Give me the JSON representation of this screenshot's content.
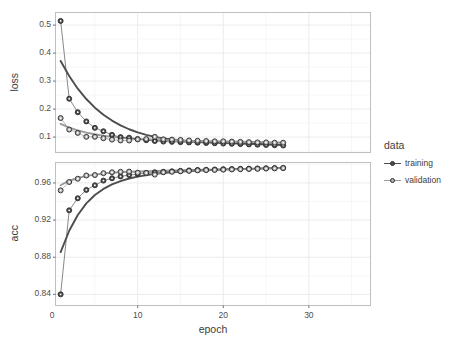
{
  "chart_data": {
    "type": "scatter",
    "title": "",
    "xlabel": "epoch",
    "legend_title": "data",
    "legend_position": "right",
    "grid": true,
    "xlim": [
      0.4,
      37.2
    ],
    "xticks": [
      0,
      10,
      20,
      30
    ],
    "xtick_labels": [
      "0",
      "10",
      "20",
      "30"
    ],
    "panels": [
      {
        "name": "loss",
        "ylabel": "loss",
        "ylim": [
          0.045,
          0.545
        ],
        "yticks": [
          0.1,
          0.2,
          0.3,
          0.4,
          0.5
        ],
        "ytick_labels": [
          "0.1",
          "0.2",
          "0.3",
          "0.4",
          "0.5"
        ],
        "series": [
          {
            "name": "training",
            "color": "#4d4d4d",
            "fill": "#4d4d4d",
            "x": [
              1,
              2,
              3,
              4,
              5,
              6,
              7,
              8,
              9,
              10,
              11,
              12,
              13,
              14,
              15,
              16,
              17,
              18,
              19,
              20,
              21,
              22,
              23,
              24,
              25,
              26,
              27
            ],
            "values": [
              0.515,
              0.237,
              0.189,
              0.156,
              0.133,
              0.121,
              0.108,
              0.1,
              0.098,
              0.093,
              0.089,
              0.086,
              0.084,
              0.083,
              0.082,
              0.081,
              0.08,
              0.079,
              0.078,
              0.077,
              0.076,
              0.075,
              0.074,
              0.073,
              0.072,
              0.071,
              0.07
            ],
            "smooth_x": [
              1.0,
              2.0,
              3.0,
              4.0,
              5.0,
              6.0,
              7.0,
              8.0,
              9.0,
              10.0,
              11.0,
              12.0,
              13.0,
              14.0,
              16.0,
              18.0,
              20.0,
              22.0,
              24.0,
              26.0,
              27.0
            ],
            "smooth_y": [
              0.372,
              0.318,
              0.273,
              0.236,
              0.205,
              0.18,
              0.159,
              0.142,
              0.128,
              0.117,
              0.108,
              0.101,
              0.0955,
              0.0912,
              0.0855,
              0.082,
              0.0795,
              0.0775,
              0.0755,
              0.0735,
              0.0725
            ]
          },
          {
            "name": "validation",
            "color": "#999999",
            "fill": "#b3b3b3",
            "x": [
              1,
              2,
              3,
              4,
              5,
              6,
              7,
              8,
              9,
              10,
              11,
              12,
              13,
              14,
              15,
              16,
              17,
              18,
              19,
              20,
              21,
              22,
              23,
              24,
              25,
              26,
              27
            ],
            "values": [
              0.168,
              0.127,
              0.115,
              0.101,
              0.101,
              0.096,
              0.091,
              0.088,
              0.088,
              0.092,
              0.093,
              0.101,
              0.092,
              0.091,
              0.09,
              0.088,
              0.087,
              0.086,
              0.085,
              0.085,
              0.084,
              0.083,
              0.082,
              0.081,
              0.081,
              0.08,
              0.08
            ],
            "smooth_x": [
              1.0,
              2.0,
              3.0,
              4.0,
              5.0,
              6.0,
              7.0,
              8.0,
              9.0,
              10.0,
              12.0,
              14.0,
              16.0,
              18.0,
              20.0,
              22.0,
              24.0,
              26.0,
              27.0
            ],
            "smooth_y": [
              0.147,
              0.134,
              0.124,
              0.116,
              0.11,
              0.105,
              0.101,
              0.0975,
              0.095,
              0.093,
              0.09,
              0.088,
              0.0865,
              0.0853,
              0.0843,
              0.0833,
              0.0823,
              0.0813,
              0.0808
            ]
          }
        ]
      },
      {
        "name": "acc",
        "ylabel": "acc",
        "ylim": [
          0.828,
          0.982
        ],
        "yticks": [
          0.84,
          0.88,
          0.92,
          0.96
        ],
        "ytick_labels": [
          "0.84",
          "0.88",
          "0.92",
          "0.96"
        ],
        "series": [
          {
            "name": "training",
            "color": "#4d4d4d",
            "fill": "#4d4d4d",
            "x": [
              1,
              2,
              3,
              4,
              5,
              6,
              7,
              8,
              9,
              10,
              11,
              12,
              13,
              14,
              15,
              16,
              17,
              18,
              19,
              20,
              21,
              22,
              23,
              24,
              25,
              26,
              27
            ],
            "values": [
              0.84,
              0.9305,
              0.9435,
              0.9525,
              0.9575,
              0.9625,
              0.965,
              0.967,
              0.9685,
              0.9695,
              0.9705,
              0.9715,
              0.972,
              0.9725,
              0.973,
              0.9735,
              0.974,
              0.9742,
              0.9745,
              0.9748,
              0.975,
              0.9752,
              0.9754,
              0.9756,
              0.9758,
              0.976,
              0.9762
            ],
            "smooth_x": [
              1.0,
              2.0,
              3.0,
              4.0,
              5.0,
              6.0,
              7.0,
              8.0,
              9.0,
              10.0,
              12.0,
              14.0,
              16.0,
              18.0,
              20.0,
              22.0,
              24.0,
              26.0,
              27.0
            ],
            "smooth_y": [
              0.8855,
              0.9085,
              0.9255,
              0.938,
              0.947,
              0.9535,
              0.9585,
              0.962,
              0.9648,
              0.9668,
              0.9697,
              0.9715,
              0.9727,
              0.9736,
              0.9743,
              0.9749,
              0.9754,
              0.9759,
              0.9761
            ]
          },
          {
            "name": "validation",
            "color": "#999999",
            "fill": "#b3b3b3",
            "x": [
              1,
              2,
              3,
              4,
              5,
              6,
              7,
              8,
              9,
              10,
              11,
              12,
              13,
              14,
              15,
              16,
              17,
              18,
              19,
              20,
              21,
              22,
              23,
              24,
              25,
              26,
              27
            ],
            "values": [
              0.952,
              0.961,
              0.9645,
              0.968,
              0.9685,
              0.9705,
              0.9715,
              0.972,
              0.9722,
              0.971,
              0.9708,
              0.969,
              0.9715,
              0.972,
              0.9725,
              0.973,
              0.9735,
              0.9738,
              0.974,
              0.9743,
              0.9745,
              0.9748,
              0.975,
              0.9752,
              0.9755,
              0.9757,
              0.976
            ],
            "smooth_x": [
              1.0,
              2.0,
              3.0,
              4.0,
              5.0,
              6.0,
              7.0,
              8.0,
              9.0,
              10.0,
              12.0,
              14.0,
              16.0,
              18.0,
              20.0,
              22.0,
              24.0,
              26.0,
              27.0
            ],
            "smooth_y": [
              0.9575,
              0.9625,
              0.9655,
              0.9675,
              0.969,
              0.9701,
              0.9709,
              0.9715,
              0.972,
              0.9724,
              0.973,
              0.9735,
              0.9739,
              0.9743,
              0.9746,
              0.975,
              0.9754,
              0.9758,
              0.976
            ]
          }
        ]
      }
    ],
    "legend_entries": [
      {
        "label": "training",
        "color": "#4d4d4d"
      },
      {
        "label": "validation",
        "color": "#999999"
      }
    ]
  },
  "colors": {
    "panel_bg": "#ffffff",
    "panel_border": "#bfbfbf",
    "grid_major": "#ebebeb",
    "grid_minor": "#f5f5f5",
    "text": "#4d4d4d",
    "training": "#4d4d4d",
    "validation": "#999999"
  }
}
